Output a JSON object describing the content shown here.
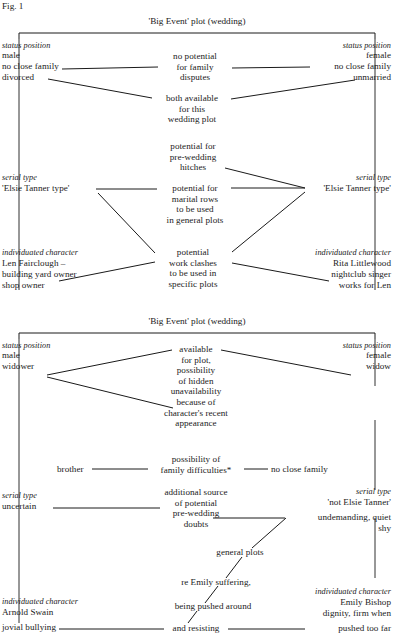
{
  "figure": {
    "label": "Fig. 1"
  },
  "diagrams": [
    {
      "id": "diagram-top",
      "caption": "'Big Event' plot (wedding)",
      "left_column": {
        "status_heading": "status position",
        "status_lines": [
          "male",
          "no close family",
          "divorced"
        ],
        "serial_heading": "serial type",
        "serial_lines": [
          "'Elsie Tanner type'"
        ],
        "character_heading": "individuated character",
        "character_lines": [
          "Len Fairclough –",
          "building yard owner",
          "shop owner"
        ]
      },
      "right_column": {
        "status_heading": "status position",
        "status_lines": [
          "female",
          "no close family",
          "unmarried"
        ],
        "serial_heading": "serial type",
        "serial_lines": [
          "'Elsie Tanner type'"
        ],
        "character_heading": "individuated character",
        "character_lines": [
          "Rita Littlewood",
          "nightclub singer",
          "works for Len"
        ]
      },
      "center_blocks": [
        {
          "id": "no-potential-family-disputes",
          "lines": [
            "no potential",
            "for family",
            "disputes"
          ]
        },
        {
          "id": "both-available",
          "lines": [
            "both available",
            "for this",
            "wedding plot"
          ]
        },
        {
          "id": "pre-wedding-hitches",
          "lines": [
            "potential for",
            "pre-wedding",
            "hitches"
          ]
        },
        {
          "id": "marital-rows",
          "lines": [
            "potential for",
            "marital rows",
            "to be used",
            "in general plots"
          ]
        },
        {
          "id": "work-clashes",
          "lines": [
            "potential",
            "work clashes",
            "to be used in",
            "specific plots"
          ]
        }
      ]
    },
    {
      "id": "diagram-bottom",
      "caption": "'Big Event' plot (wedding)",
      "left_column": {
        "status_heading": "status position",
        "status_lines": [
          "male",
          "widower"
        ],
        "serial_heading": "serial type",
        "serial_lines": [
          "uncertain"
        ],
        "character_heading": "individuated character",
        "character_lines": [
          "Arnold Swain",
          "jovial bullying"
        ]
      },
      "right_column": {
        "status_heading": "status position",
        "status_lines": [
          "female",
          "widow"
        ],
        "serial_heading": "serial type",
        "serial_lines": [
          "'not Elsie Tanner'",
          "undemanding, quiet",
          "shy"
        ],
        "character_heading": "individuated character",
        "character_lines": [
          "Emily Bishop",
          "dignity, firm when",
          "pushed too far"
        ]
      },
      "center_blocks": [
        {
          "id": "available-for-plot",
          "lines": [
            "available",
            "for plot,",
            "possibility",
            "of hidden",
            "unavailability",
            "because of",
            "character's recent",
            "appearance"
          ]
        },
        {
          "id": "family-difficulties",
          "lines": [
            "possibility of",
            "family difficulties*"
          ]
        },
        {
          "id": "pre-wedding-doubts",
          "lines": [
            "additional source",
            "of potential",
            "pre-wedding",
            "doubts"
          ]
        },
        {
          "id": "general-plots",
          "lines": [
            "general plots"
          ]
        },
        {
          "id": "emily-suffering",
          "lines": [
            "re Emily suffering,"
          ]
        },
        {
          "id": "being-pushed-around",
          "lines": [
            "being pushed around"
          ]
        },
        {
          "id": "and-resisting",
          "lines": [
            "and resisting"
          ]
        }
      ],
      "side_labels": {
        "brother": "brother",
        "no_close_family": "no close family"
      }
    }
  ],
  "colors": {
    "ink": "#1a1a1a",
    "paper": "#ffffff"
  }
}
